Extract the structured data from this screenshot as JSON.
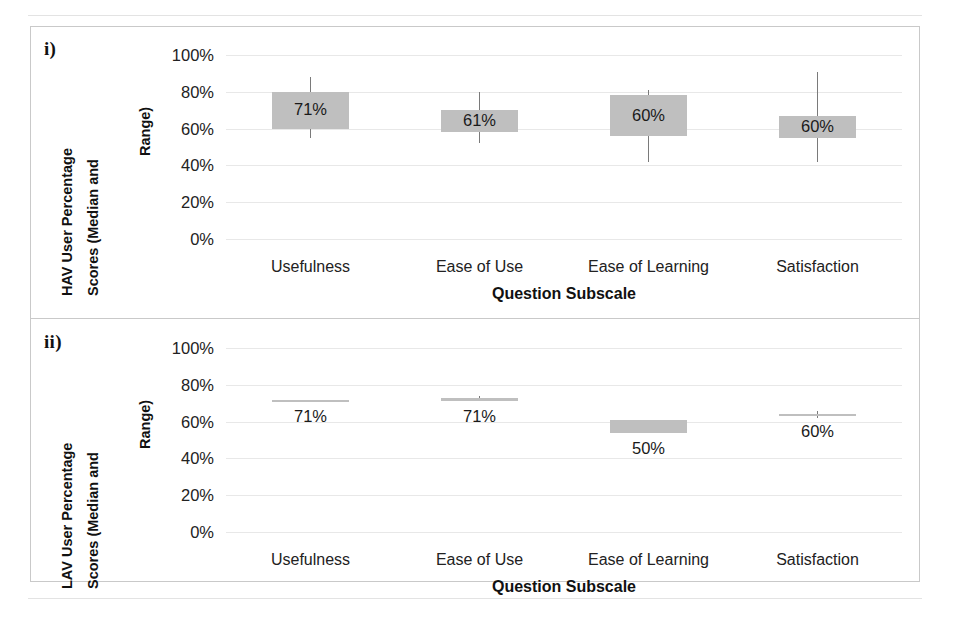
{
  "figure": {
    "background": "#ffffff",
    "box_fill": "#bfbfbf",
    "whisker_color": "#7a7a7a",
    "gridline_color": "#e8e8e8",
    "frame_color": "#c9c9c9"
  },
  "panels": [
    {
      "tag": "i)",
      "ylabel_line1": "HAV User Percentage",
      "ylabel_line2": "Scores (Median and",
      "ylabel_line3": "Range)",
      "xtitle": "Question Subscale"
    },
    {
      "tag": "ii)",
      "ylabel_line1": "LAV User Percentage",
      "ylabel_line2": "Scores (Median and",
      "ylabel_line3": "Range)",
      "xtitle": "Question Subscale"
    }
  ],
  "axis": {
    "yticks": [
      "0%",
      "20%",
      "40%",
      "60%",
      "80%",
      "100%"
    ],
    "ytick_values": [
      0,
      20,
      40,
      60,
      80,
      100
    ],
    "ymin": 0,
    "ymax": 100,
    "categories": [
      "Usefulness",
      "Ease of Use",
      "Ease of Learning",
      "Satisfaction"
    ]
  },
  "chart_data": [
    {
      "type": "box",
      "title": "i) HAV User Percentage Scores (Median and Range)",
      "panel": "i)",
      "xlabel": "Question Subscale",
      "ylabel": "HAV User Percentage Scores (Median and Range)",
      "ylim": [
        0,
        100
      ],
      "yticks": [
        0,
        20,
        40,
        60,
        80,
        100
      ],
      "grid": true,
      "legend": "none",
      "categories": [
        "Usefulness",
        "Ease of Use",
        "Ease of Learning",
        "Satisfaction"
      ],
      "boxes": [
        {
          "category": "Usefulness",
          "label": "71%",
          "median": 71,
          "box_low": 60,
          "box_high": 80,
          "whisker_low": 55,
          "whisker_high": 88,
          "label_position": "inside"
        },
        {
          "category": "Ease of Use",
          "label": "61%",
          "median": 61,
          "box_low": 58,
          "box_high": 70,
          "whisker_low": 52,
          "whisker_high": 80,
          "label_position": "inside"
        },
        {
          "category": "Ease of Learning",
          "label": "60%",
          "median": 60,
          "box_low": 56,
          "box_high": 78,
          "whisker_low": 42,
          "whisker_high": 81,
          "label_position": "inside"
        },
        {
          "category": "Satisfaction",
          "label": "60%",
          "median": 60,
          "box_low": 55,
          "box_high": 67,
          "whisker_low": 42,
          "whisker_high": 91,
          "label_position": "inside"
        }
      ]
    },
    {
      "type": "box",
      "title": "ii) LAV User Percentage Scores (Median and Range)",
      "panel": "ii)",
      "xlabel": "Question Subscale",
      "ylabel": "LAV User Percentage Scores (Median and Range)",
      "ylim": [
        0,
        100
      ],
      "yticks": [
        0,
        20,
        40,
        60,
        80,
        100
      ],
      "grid": true,
      "legend": "none",
      "categories": [
        "Usefulness",
        "Ease of Use",
        "Ease of Learning",
        "Satisfaction"
      ],
      "boxes": [
        {
          "category": "Usefulness",
          "label": "71%",
          "median": 71,
          "box_low": 71,
          "box_high": 72,
          "whisker_low": 71,
          "whisker_high": 72,
          "label_position": "below"
        },
        {
          "category": "Ease of Use",
          "label": "71%",
          "median": 71,
          "box_low": 71,
          "box_high": 73,
          "whisker_low": 71,
          "whisker_high": 74,
          "label_position": "below"
        },
        {
          "category": "Ease of Learning",
          "label": "50%",
          "median": 50,
          "box_low": 54,
          "box_high": 61,
          "whisker_low": 54,
          "whisker_high": 61,
          "label_position": "below"
        },
        {
          "category": "Satisfaction",
          "label": "60%",
          "median": 60,
          "box_low": 63,
          "box_high": 64,
          "whisker_low": 62,
          "whisker_high": 66,
          "label_position": "below"
        }
      ]
    }
  ]
}
